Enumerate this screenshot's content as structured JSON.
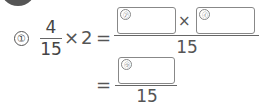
{
  "problem": {
    "number_label": "①",
    "fraction": {
      "numerator": "4",
      "denominator": "15"
    },
    "times": "×",
    "multiplier": "2",
    "equals": "=",
    "step1": {
      "box_a_label": "㋐",
      "box_b_label": "㋑",
      "operator": "×",
      "denominator": "15"
    },
    "step2": {
      "box_c_label": "㋒",
      "denominator": "15"
    }
  }
}
